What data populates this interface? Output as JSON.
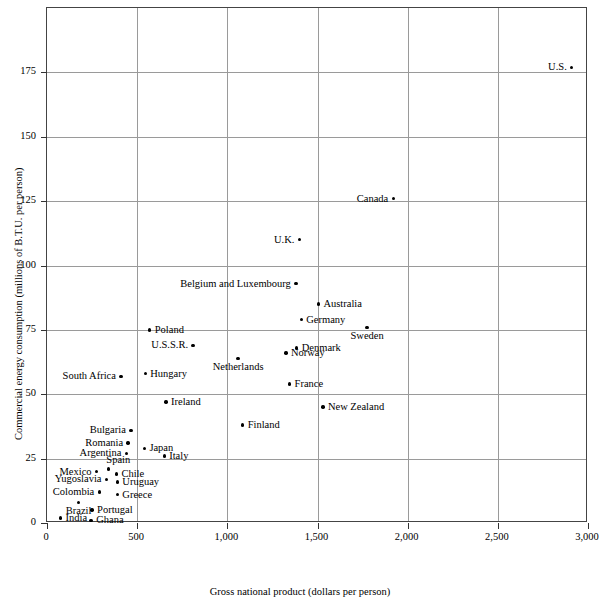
{
  "chart_data": {
    "type": "scatter",
    "title": "",
    "xlabel": "Gross national product (dollars per person)",
    "ylabel": "Commercial energy consumption (millions of B.T.U. per person)",
    "xlim": [
      0,
      3000
    ],
    "ylim": [
      0,
      200
    ],
    "xticks": [
      0,
      500,
      1000,
      1500,
      2000,
      2500,
      3000
    ],
    "xtick_labels": [
      "0",
      "500",
      "1,000",
      "1,500",
      "2,000",
      "2,500",
      "3,000"
    ],
    "yticks": [
      0,
      25,
      50,
      75,
      100,
      125,
      150,
      175
    ],
    "ytick_labels": [
      "0",
      "25",
      "50",
      "75",
      "100",
      "125",
      "150",
      "175"
    ],
    "grid": true,
    "legend": "none",
    "point_color": "#000000",
    "grid_color": "#9a9a9a",
    "points": [
      {
        "label": "U.S.",
        "x": 2910,
        "y": 177,
        "pos": "left"
      },
      {
        "label": "Canada",
        "x": 1920,
        "y": 126,
        "pos": "left"
      },
      {
        "label": "U.K.",
        "x": 1400,
        "y": 110,
        "pos": "left"
      },
      {
        "label": "Belgium and Luxembourg",
        "x": 1380,
        "y": 93,
        "pos": "left"
      },
      {
        "label": "Australia",
        "x": 1505,
        "y": 85,
        "pos": "right"
      },
      {
        "label": "Germany",
        "x": 1410,
        "y": 79,
        "pos": "right"
      },
      {
        "label": "Sweden",
        "x": 1775,
        "y": 76,
        "pos": "below"
      },
      {
        "label": "Poland",
        "x": 570,
        "y": 75,
        "pos": "right"
      },
      {
        "label": "U.S.S.R.",
        "x": 810,
        "y": 69,
        "pos": "left"
      },
      {
        "label": "Denmark",
        "x": 1385,
        "y": 68,
        "pos": "right"
      },
      {
        "label": "Norway",
        "x": 1325,
        "y": 66,
        "pos": "right"
      },
      {
        "label": "Netherlands",
        "x": 1060,
        "y": 64,
        "pos": "below"
      },
      {
        "label": "Hungary",
        "x": 545,
        "y": 58,
        "pos": "right"
      },
      {
        "label": "South Africa",
        "x": 410,
        "y": 57,
        "pos": "left"
      },
      {
        "label": "France",
        "x": 1345,
        "y": 54,
        "pos": "right"
      },
      {
        "label": "Ireland",
        "x": 660,
        "y": 47,
        "pos": "right"
      },
      {
        "label": "New Zealand",
        "x": 1530,
        "y": 45,
        "pos": "right"
      },
      {
        "label": "Finland",
        "x": 1085,
        "y": 38,
        "pos": "right"
      },
      {
        "label": "Bulgaria",
        "x": 465,
        "y": 36,
        "pos": "left"
      },
      {
        "label": "Romania",
        "x": 450,
        "y": 31,
        "pos": "left"
      },
      {
        "label": "Japan",
        "x": 540,
        "y": 29,
        "pos": "right"
      },
      {
        "label": "Argentina",
        "x": 440,
        "y": 27,
        "pos": "left"
      },
      {
        "label": "Italy",
        "x": 650,
        "y": 26,
        "pos": "right"
      },
      {
        "label": "Spain",
        "x": 340,
        "y": 21,
        "pos": "above-right"
      },
      {
        "label": "Mexico",
        "x": 275,
        "y": 20,
        "pos": "left"
      },
      {
        "label": "Chile",
        "x": 385,
        "y": 19,
        "pos": "right"
      },
      {
        "label": "Yugoslavia",
        "x": 330,
        "y": 17,
        "pos": "left"
      },
      {
        "label": "Uruguay",
        "x": 390,
        "y": 16,
        "pos": "right"
      },
      {
        "label": "Colombia",
        "x": 290,
        "y": 12,
        "pos": "left"
      },
      {
        "label": "Greece",
        "x": 390,
        "y": 11,
        "pos": "right"
      },
      {
        "label": "Brazil",
        "x": 175,
        "y": 8,
        "pos": "below"
      },
      {
        "label": "Portugal",
        "x": 250,
        "y": 5,
        "pos": "right"
      },
      {
        "label": "India",
        "x": 75,
        "y": 2,
        "pos": "right"
      },
      {
        "label": "Ghana",
        "x": 245,
        "y": 1,
        "pos": "right"
      }
    ]
  }
}
